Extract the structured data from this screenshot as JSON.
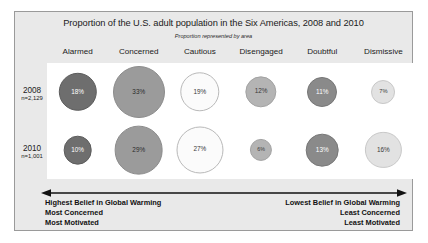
{
  "chart_data": {
    "type": "bubble",
    "title": "Proportion of the U.S. adult population in the Six Americas, 2008 and 2010",
    "subtitle": "Proportion represented by area",
    "xlabel": "",
    "ylabel": "",
    "categories": [
      "Alarmed",
      "Concerned",
      "Cautious",
      "Disengaged",
      "Doubtful",
      "Dismissive"
    ],
    "series": [
      {
        "name": "2008",
        "n_label": "n=2,129",
        "values": [
          18,
          33,
          19,
          12,
          11,
          7
        ],
        "value_labels": [
          "18%",
          "33%",
          "19%",
          "12%",
          "11%",
          "7%"
        ]
      },
      {
        "name": "2010",
        "n_label": "n=1,001",
        "values": [
          10,
          29,
          27,
          6,
          13,
          16
        ],
        "value_labels": [
          "10%",
          "29%",
          "27%",
          "6%",
          "13%",
          "16%"
        ]
      }
    ],
    "category_colors": [
      "#6e6e6e",
      "#9b9b9b",
      "#fbfbfb",
      "#b4b4b4",
      "#8a8a8a",
      "#e2e2e2"
    ],
    "category_text_colors": [
      "#ffffff",
      "#2b2b2b",
      "#3a3a3a",
      "#3a3a3a",
      "#ffffff",
      "#3a3a3a"
    ],
    "category_stroke_colors": [
      "#5c5c5c",
      "#8c8c8c",
      "#b9b9b9",
      "#a3a3a3",
      "#777777",
      "#c8c8c8"
    ],
    "annotation_left": [
      "Highest Belief in Global Warming",
      "Most Concerned",
      "Most Motivated"
    ],
    "annotation_right": [
      "Lowest Belief in Global Warming",
      "Least Concerned",
      "Least Motivated"
    ],
    "axis_arrow": "double-headed-horizontal-arrow",
    "grid": false,
    "legend": "none"
  },
  "panel": {
    "background_color": "#e9e9e9",
    "border_color": "#9a9a9a",
    "plot_background_color": "#ffffff"
  }
}
